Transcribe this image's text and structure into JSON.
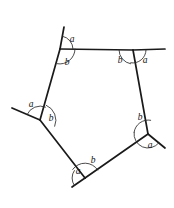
{
  "figure": {
    "type": "geometry-diagram",
    "shape": "pentagon",
    "stroke_color": "#1a1a1a",
    "arc_color": "#2b2b2b",
    "background_color": "#ffffff",
    "label_color": "#111111",
    "exterior_label": "a",
    "interior_label": "b",
    "vertices": [
      {
        "name": "top-left",
        "x": 60,
        "y": 49
      },
      {
        "name": "top-right",
        "x": 133,
        "y": 50
      },
      {
        "name": "right",
        "x": 148,
        "y": 134
      },
      {
        "name": "bottom",
        "x": 85,
        "y": 178
      },
      {
        "name": "left",
        "x": 40,
        "y": 120
      }
    ],
    "sides": [
      {
        "name": "top",
        "from": "top-left",
        "to": "top-right"
      },
      {
        "name": "upper-right",
        "from": "top-right",
        "to": "right"
      },
      {
        "name": "lower-right",
        "from": "right",
        "to": "bottom"
      },
      {
        "name": "lower-left",
        "from": "bottom",
        "to": "left"
      },
      {
        "name": "upper-left",
        "from": "left",
        "to": "top-left"
      }
    ],
    "extension_rays": [
      {
        "name": "ray-from-top-left",
        "x1": 60,
        "y1": 49,
        "x2": 64,
        "y2": 27
      },
      {
        "name": "ray-from-top-right",
        "x1": 133,
        "y1": 50,
        "x2": 165,
        "y2": 49
      },
      {
        "name": "ray-from-right",
        "x1": 148,
        "y1": 134,
        "x2": 165,
        "y2": 148
      },
      {
        "name": "ray-from-bottom",
        "x1": 85,
        "y1": 178,
        "x2": 72,
        "y2": 187
      },
      {
        "name": "ray-from-left",
        "x1": 40,
        "y1": 120,
        "x2": 12,
        "y2": 108
      }
    ],
    "angle_marks": [
      {
        "vertex": "top-left",
        "angle": "a",
        "label_x": 72,
        "label_y": 40,
        "arc_radius": 13,
        "start_deg": -79,
        "end_deg": 0
      },
      {
        "vertex": "top-left",
        "angle": "b",
        "label_x": 67,
        "label_y": 63,
        "arc_radius": 15,
        "start_deg": 0,
        "end_deg": 101
      },
      {
        "vertex": "top-right",
        "angle": "b",
        "label_x": 120,
        "label_y": 61,
        "arc_radius": 14,
        "start_deg": 100,
        "end_deg": 180
      },
      {
        "vertex": "top-right",
        "angle": "a",
        "label_x": 145,
        "label_y": 61,
        "arc_radius": 13,
        "start_deg": 0,
        "end_deg": 100
      },
      {
        "vertex": "right",
        "angle": "b",
        "label_x": 140,
        "label_y": 118,
        "arc_radius": 14,
        "start_deg": 187,
        "end_deg": 281
      },
      {
        "vertex": "right",
        "angle": "a",
        "label_x": 150,
        "label_y": 146,
        "arc_radius": 14,
        "start_deg": 39,
        "end_deg": 187
      },
      {
        "vertex": "bottom",
        "angle": "b",
        "label_x": 93,
        "label_y": 161,
        "arc_radius": 15,
        "start_deg": 215,
        "end_deg": 328
      },
      {
        "vertex": "bottom",
        "angle": "a",
        "label_x": 78,
        "label_y": 172,
        "arc_radius": 13,
        "start_deg": 145,
        "end_deg": 215
      },
      {
        "vertex": "left",
        "angle": "a",
        "label_x": 31,
        "label_y": 105,
        "arc_radius": 14,
        "start_deg": 203,
        "end_deg": 293
      },
      {
        "vertex": "left",
        "angle": "b",
        "label_x": 51,
        "label_y": 119,
        "arc_radius": 16,
        "start_deg": 293,
        "end_deg": 383
      }
    ]
  }
}
